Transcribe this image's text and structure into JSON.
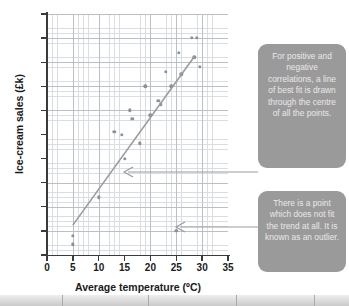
{
  "chart_data": {
    "type": "scatter",
    "title": "",
    "xlabel": "Average temperature (ºC)",
    "ylabel": "Ice-cream sales (£k)",
    "xlim": [
      0,
      35
    ],
    "ylim": [
      0,
      500
    ],
    "xticks": [
      0,
      5,
      10,
      15,
      20,
      25,
      30,
      35
    ],
    "yticks": [
      0,
      50,
      100,
      150,
      200,
      250,
      300,
      350,
      400,
      450,
      500
    ],
    "grid": true,
    "legend": "none",
    "point_color": "#8e9199",
    "line_color": "#9b9b9b",
    "series": [
      {
        "name": "Ice-cream sales",
        "points": [
          [
            5,
            40
          ],
          [
            5,
            22
          ],
          [
            10,
            120
          ],
          [
            13,
            255
          ],
          [
            14.5,
            250
          ],
          [
            16,
            300
          ],
          [
            16.5,
            282
          ],
          [
            15,
            200
          ],
          [
            18,
            232
          ],
          [
            19,
            350
          ],
          [
            20,
            290
          ],
          [
            21.5,
            320
          ],
          [
            22,
            313
          ],
          [
            23,
            380
          ],
          [
            24,
            350
          ],
          [
            25,
            50
          ],
          [
            25.5,
            420
          ],
          [
            26,
            375
          ],
          [
            28,
            450
          ],
          [
            29,
            450
          ],
          [
            28.5,
            410
          ],
          [
            29.5,
            390
          ]
        ]
      }
    ],
    "best_fit_line": {
      "label": "line of best fit",
      "x_start": 5,
      "y_start": 62,
      "x_end": 28.5,
      "y_end": 412
    },
    "outlier": {
      "x": 25,
      "y": 50
    }
  },
  "annotations": {
    "callout_1": {
      "name": "line-of-best-fit-note",
      "text": "For positive and negative correlations, a line of best fit is drawn through the centre of all the points."
    },
    "callout_2": {
      "name": "outlier-note",
      "text": "There is a point which does not fit the trend at all. It is known as an outlier."
    }
  },
  "colors": {
    "callout_bg": "#9a9a9a",
    "callout_text": "#e9e9e9",
    "grid_minor": "#d9dde4",
    "grid_major": "#b9c0c9",
    "axis": "#3a3a3a"
  }
}
